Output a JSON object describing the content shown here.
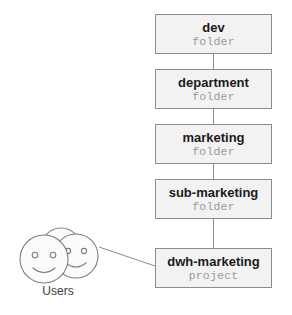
{
  "diagram": {
    "accent_color": "#f2f2f2",
    "border_color": "#8c8c8c",
    "name_color": "#1a1a1a",
    "type_color": "#9a9a9a",
    "nodes": [
      {
        "name": "dev",
        "type": "folder"
      },
      {
        "name": "department",
        "type": "folder"
      },
      {
        "name": "marketing",
        "type": "folder"
      },
      {
        "name": "sub-marketing",
        "type": "folder"
      },
      {
        "name": "dwh-marketing",
        "type": "project"
      }
    ],
    "users": {
      "label": "Users",
      "icon": "users-smiley-icon",
      "face_count": 3
    },
    "connections": [
      {
        "from": "dev",
        "to": "department"
      },
      {
        "from": "department",
        "to": "marketing"
      },
      {
        "from": "marketing",
        "to": "sub-marketing"
      },
      {
        "from": "sub-marketing",
        "to": "dwh-marketing"
      },
      {
        "from": "Users",
        "to": "dwh-marketing"
      }
    ]
  }
}
